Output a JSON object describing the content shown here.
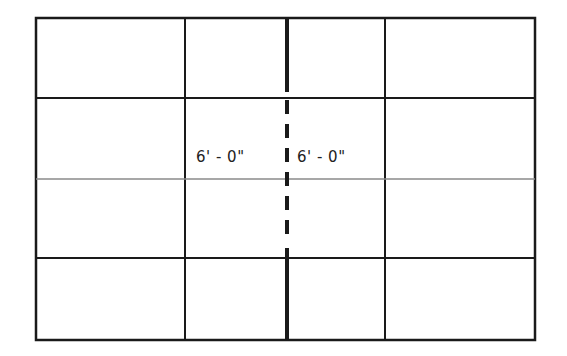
{
  "diagram": {
    "type": "grid-layout",
    "rows": 4,
    "columns": 4,
    "center_line_style": "solid-dashed-solid",
    "colors": {
      "line": "#1a1a1a",
      "middle_line": "#8a8a8a",
      "background": "#ffffff"
    },
    "dimensions": [
      {
        "label": "6' - 0\""
      },
      {
        "label": "6' - 0\""
      }
    ]
  }
}
